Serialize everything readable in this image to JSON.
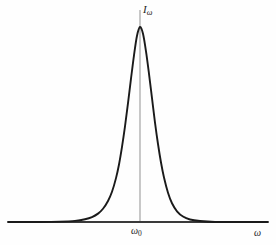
{
  "figure": {
    "width": 276,
    "height": 245,
    "background_color": "#fefefe"
  },
  "labels": {
    "y_axis_symbol": "I",
    "y_axis_subscript": "ω",
    "x_tick_symbol": "ω",
    "x_tick_subscript": "0",
    "x_axis_symbol": "ω"
  },
  "colors": {
    "curve": "#1a1a1a",
    "baseline": "#3a3a3a",
    "center_line": "#9a9a9a",
    "text": "#1c1c1c"
  },
  "chart_data": {
    "type": "line",
    "title": "",
    "subtitle": "",
    "xlabel": "ω",
    "ylabel": "Iω",
    "grid": false,
    "legend": null,
    "annotations": [
      {
        "text": "ω₀",
        "kind": "x-tick-label",
        "x_px": 140,
        "y_px": 233,
        "meaning": "center frequency of the spectral line"
      },
      {
        "text": "Iω",
        "kind": "y-axis-label",
        "x_px": 146,
        "y_px": 12,
        "meaning": "spectral intensity at frequency omega"
      },
      {
        "text": "ω",
        "kind": "x-axis-label",
        "x_px": 258,
        "y_px": 234,
        "meaning": "frequency axis"
      }
    ],
    "xlim": [
      0,
      276
    ],
    "ylim": [
      0,
      1
    ],
    "xticks": [
      "ω₀"
    ],
    "xtick_positions_px": [
      140
    ],
    "yticks": [],
    "series": [
      {
        "name": "spectral line profile",
        "shape": "lorentzian-like emission peak",
        "peak_x_px": 140,
        "peak_y_px": 27,
        "baseline_y_px": 222,
        "fwhm_px": 34,
        "x": [
          8,
          20,
          40,
          60,
          75,
          85,
          92,
          98,
          103,
          108,
          112,
          116,
          119,
          122,
          125,
          128,
          131,
          134,
          137,
          140,
          143,
          146,
          149,
          152,
          155,
          158,
          161,
          164,
          168,
          172,
          177,
          183,
          190,
          200,
          215,
          235,
          255,
          268
        ],
        "values": [
          0.0,
          0.0,
          0.0,
          0.002,
          0.006,
          0.014,
          0.025,
          0.043,
          0.068,
          0.108,
          0.155,
          0.225,
          0.295,
          0.385,
          0.49,
          0.61,
          0.735,
          0.855,
          0.955,
          1.0,
          0.965,
          0.875,
          0.76,
          0.635,
          0.51,
          0.4,
          0.305,
          0.228,
          0.15,
          0.096,
          0.055,
          0.028,
          0.013,
          0.005,
          0.0,
          0.0,
          0.0,
          0.0
        ]
      }
    ],
    "center_line": {
      "name": "center frequency marker",
      "x_px": 140,
      "y_top_px": 10,
      "y_bottom_px": 222
    },
    "baseline": {
      "name": "horizontal frequency axis",
      "x_start_px": 8,
      "x_end_px": 268,
      "y_px": 222
    }
  }
}
